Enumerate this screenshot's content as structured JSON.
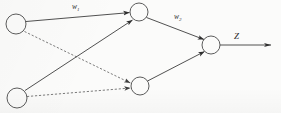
{
  "figure": {
    "background_color": "#fbfbfa",
    "stroke_color": "#3d3d3d",
    "node_fill": "#fbfbfa"
  },
  "labels": {
    "w1": {
      "base": "w",
      "subscript": "1",
      "x": 72,
      "y": 9
    },
    "w2": {
      "base": "w",
      "subscript": "2",
      "x": 174,
      "y": 19
    },
    "z": {
      "text": "Z",
      "x": 234,
      "y": 39
    }
  },
  "nodes": [
    {
      "id": "input-1",
      "layer": "input",
      "cx": 16,
      "cy": 24,
      "r": 10
    },
    {
      "id": "input-2",
      "layer": "input",
      "cx": 17,
      "cy": 98,
      "r": 10
    },
    {
      "id": "hidden-1",
      "layer": "hidden",
      "cx": 139,
      "cy": 12,
      "r": 9
    },
    {
      "id": "hidden-2",
      "layer": "hidden",
      "cx": 140,
      "cy": 86,
      "r": 9
    },
    {
      "id": "output-1",
      "layer": "output",
      "cx": 211,
      "cy": 45,
      "r": 9
    }
  ],
  "edges": [
    {
      "id": "input1-to-hidden1",
      "from": "input-1",
      "to": "hidden-1",
      "style": "solid",
      "label": "w1",
      "arrow": true
    },
    {
      "id": "input1-to-hidden2",
      "from": "input-1",
      "to": "hidden-2",
      "style": "dashed",
      "label": "",
      "arrow": true
    },
    {
      "id": "input2-to-hidden1",
      "from": "input-2",
      "to": "hidden-1",
      "style": "solid",
      "label": "",
      "arrow": true
    },
    {
      "id": "input2-to-hidden2",
      "from": "input-2",
      "to": "hidden-2",
      "style": "dashed",
      "label": "",
      "arrow": true
    },
    {
      "id": "hidden1-to-output",
      "from": "hidden-1",
      "to": "output-1",
      "style": "solid",
      "label": "w2",
      "arrow": true
    },
    {
      "id": "hidden2-to-output",
      "from": "hidden-2",
      "to": "output-1",
      "style": "solid",
      "label": "",
      "arrow": true
    }
  ],
  "output_arrow": {
    "id": "output-signal-arrow",
    "from": "output-1",
    "x1": 220,
    "y1": 45,
    "x2": 272,
    "y2": 45,
    "label": "z",
    "style": "solid",
    "arrow": true
  }
}
